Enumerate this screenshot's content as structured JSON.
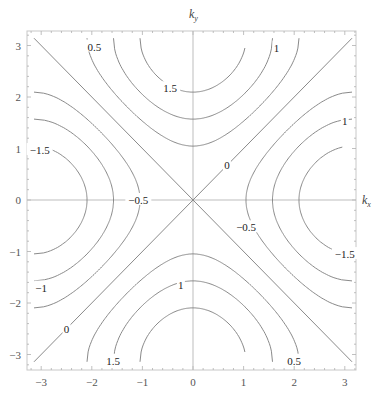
{
  "chart_data": {
    "type": "contour",
    "title": "",
    "xlabel": "k_x",
    "ylabel": "k_y",
    "function_shape": "cos(kx) - cos(ky)",
    "xlim": [
      -3.27,
      3.21
    ],
    "ylim": [
      -3.28,
      3.28
    ],
    "data_range": [
      -3.1416,
      3.1416
    ],
    "grid": false,
    "axes_through_origin": true,
    "x_ticks": [
      -3,
      -2,
      -1,
      0,
      1,
      2,
      3
    ],
    "y_ticks": [
      -3,
      -2,
      -1,
      0,
      1,
      2,
      3
    ],
    "x_tick_labels": [
      "−3",
      "−2",
      "−1",
      "0",
      "1",
      "2",
      "3"
    ],
    "y_tick_labels": [
      "−3",
      "−2",
      "−1",
      "0",
      "1",
      "2",
      "3"
    ],
    "levels": [
      -1.5,
      -1,
      -0.5,
      0,
      0.5,
      1,
      1.5
    ],
    "contour_labels": [
      {
        "text": "0.5",
        "x": -1.95,
        "y": 2.98
      },
      {
        "text": "1",
        "x": 1.65,
        "y": 2.96
      },
      {
        "text": "1.5",
        "x": -0.45,
        "y": 2.17
      },
      {
        "text": "−1.5",
        "x": -3.03,
        "y": 0.97
      },
      {
        "text": "−0.5",
        "x": -1.08,
        "y": 0.0
      },
      {
        "text": "0",
        "x": 0.67,
        "y": 0.68
      },
      {
        "text": "1",
        "x": 3.0,
        "y": 1.53
      },
      {
        "text": "−0.5",
        "x": 1.05,
        "y": -0.53
      },
      {
        "text": "−1.5",
        "x": 3.0,
        "y": -1.05
      },
      {
        "text": "−1",
        "x": -3.0,
        "y": -1.7
      },
      {
        "text": "1",
        "x": -0.24,
        "y": -1.65
      },
      {
        "text": "0",
        "x": -2.5,
        "y": -2.5
      },
      {
        "text": "1.5",
        "x": -1.58,
        "y": -3.12
      },
      {
        "text": "0.5",
        "x": 2.0,
        "y": -3.12
      }
    ],
    "line_color": "#8a8a8a",
    "axis_color": "#bdbdbd"
  }
}
